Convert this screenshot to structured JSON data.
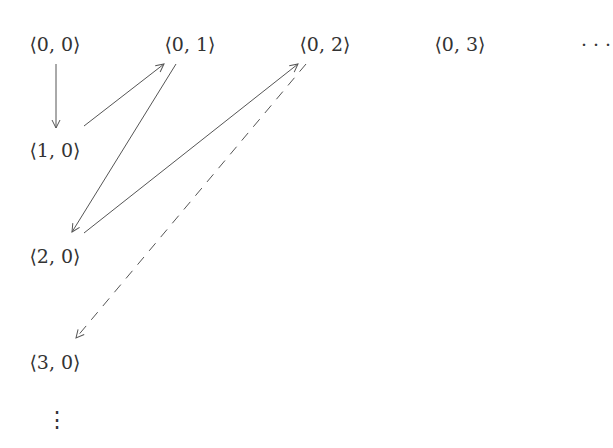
{
  "diagram": {
    "title": "",
    "nodes": [
      {
        "id": "n00",
        "label": "⟨0, 0⟩",
        "x": 55,
        "y": 44
      },
      {
        "id": "n01",
        "label": "⟨0, 1⟩",
        "x": 190,
        "y": 44
      },
      {
        "id": "n02",
        "label": "⟨0, 2⟩",
        "x": 325,
        "y": 44
      },
      {
        "id": "n03",
        "label": "⟨0, 3⟩",
        "x": 460,
        "y": 44
      },
      {
        "id": "hdots",
        "label": "· · ·",
        "x": 598,
        "y": 44
      },
      {
        "id": "n10",
        "label": "⟨1, 0⟩",
        "x": 55,
        "y": 150
      },
      {
        "id": "n20",
        "label": "⟨2, 0⟩",
        "x": 55,
        "y": 256
      },
      {
        "id": "n30",
        "label": "⟨3, 0⟩",
        "x": 55,
        "y": 362
      }
    ],
    "vdots_label": "⋮",
    "edges": [
      {
        "from": "n00",
        "to": "n10",
        "style": "solid"
      },
      {
        "from": "n10",
        "to": "n01",
        "style": "solid"
      },
      {
        "from": "n01",
        "to": "n20",
        "style": "solid"
      },
      {
        "from": "n20",
        "to": "n02",
        "style": "solid"
      },
      {
        "from": "n02",
        "to": "n30",
        "style": "dashed"
      }
    ],
    "stroke_color": "#555555"
  }
}
